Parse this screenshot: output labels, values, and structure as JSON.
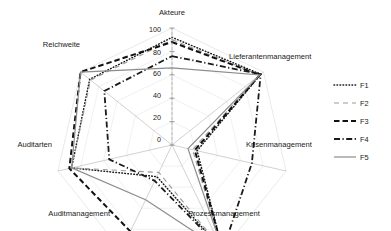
{
  "chart_data": {
    "type": "radar",
    "title": "",
    "categories": [
      "Akteure",
      "Lieferantenmanagement",
      "Krisenmanagement",
      "Prozessmanagement",
      "Auditmanagement",
      "Auditarten",
      "Reichweite"
    ],
    "series": [
      {
        "name": "F1",
        "style": "dotted",
        "color": "#1a1a1a",
        "values": [
          92,
          97,
          22,
          100,
          30,
          88,
          90
        ]
      },
      {
        "name": "F2",
        "style": "dashed-light",
        "color": "#9a9a9a",
        "values": [
          90,
          96,
          18,
          99,
          26,
          88,
          89
        ]
      },
      {
        "name": "F3",
        "style": "dashed-bold",
        "color": "#111111",
        "values": [
          88,
          96,
          20,
          100,
          82,
          90,
          100
        ]
      },
      {
        "name": "F4",
        "style": "dash-dot",
        "color": "#1a1a1a",
        "values": [
          76,
          97,
          70,
          100,
          34,
          55,
          74
        ]
      },
      {
        "name": "F5",
        "style": "solid",
        "color": "#8c8c8c",
        "values": [
          66,
          96,
          14,
          100,
          52,
          88,
          100
        ]
      }
    ],
    "radial_ticks": [
      0,
      20,
      40,
      60,
      80,
      100
    ],
    "rmin": 0,
    "rmax": 100,
    "grid": true,
    "legend_position": "right",
    "xlabel": "",
    "ylabel": ""
  },
  "legend": {
    "entries": [
      {
        "label": "F1"
      },
      {
        "label": "F2"
      },
      {
        "label": "F3"
      },
      {
        "label": "F4"
      },
      {
        "label": "F5"
      }
    ]
  },
  "axis_labels": {
    "akteure": "Akteure",
    "lieferantenmanagement": "Lieferantenmanagement",
    "krisenmanagement": "Krisenmanagement",
    "prozessmanagement": "Prozessmanagement",
    "auditmanagement": "Auditmanagement",
    "auditarten": "Auditarten",
    "reichweite": "Reichweite"
  },
  "radial_tick_labels": {
    "t100": "100",
    "t80": "80",
    "t60": "60",
    "t40": "40",
    "t20": "20",
    "t0": "0"
  }
}
